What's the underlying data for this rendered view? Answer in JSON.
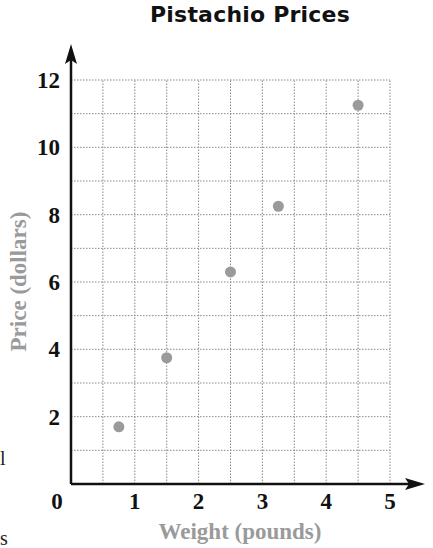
{
  "chart_data": {
    "type": "scatter",
    "title": "Pistachio Prices",
    "xlabel": "Weight (pounds)",
    "ylabel": "Price (dollars)",
    "xlim": [
      0,
      5
    ],
    "ylim": [
      0,
      12
    ],
    "x_ticks": [
      "0",
      "1",
      "2",
      "3",
      "4",
      "5"
    ],
    "y_ticks": [
      "2",
      "4",
      "6",
      "8",
      "10",
      "12"
    ],
    "grid": true,
    "grid_style": "dotted",
    "x_grid_step": 0.5,
    "y_grid_step": 1,
    "legend": null,
    "series": [
      {
        "name": "Pistachio Prices",
        "color": "#999999",
        "points": [
          {
            "x": 0.75,
            "y": 1.7
          },
          {
            "x": 1.5,
            "y": 3.75
          },
          {
            "x": 2.5,
            "y": 6.3
          },
          {
            "x": 3.25,
            "y": 8.25
          },
          {
            "x": 4.5,
            "y": 11.25
          }
        ]
      }
    ]
  },
  "labels": {
    "title": "Pistachio Prices",
    "xlabel": "Weight (pounds)",
    "ylabel": "Price (dollars)",
    "origin": "0"
  },
  "edge_fragments": {
    "left_mid": "l",
    "left_bottom": "s"
  },
  "colors": {
    "axis": "#111111",
    "grid": "#888888",
    "point": "#9a9a9a",
    "axis_label": "#9a9a9a"
  }
}
